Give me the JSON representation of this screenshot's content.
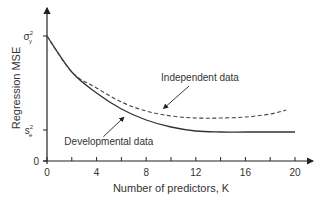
{
  "chart_data": {
    "type": "line",
    "title": "",
    "xlabel": "Number of predictors, K",
    "ylabel": "Regression MSE",
    "xlim": [
      0,
      21
    ],
    "x_ticks": [
      0,
      4,
      8,
      12,
      16,
      20
    ],
    "x_minor_ticks": [
      2,
      6,
      10,
      14,
      18
    ],
    "y_ticks": [
      {
        "value": 0,
        "label": "0"
      },
      {
        "value": 0.248,
        "label": "s_e^2",
        "symbol": "s",
        "sub": "e",
        "sup": "2"
      },
      {
        "value": 1.0,
        "label": "σ_y^2",
        "symbol": "σ",
        "sub": "y",
        "sup": "2"
      }
    ],
    "grid": false,
    "series": [
      {
        "name": "Developmental data",
        "style": "solid",
        "x": [
          0,
          2,
          4,
          6,
          8,
          10,
          12,
          14,
          16,
          18,
          20
        ],
        "values": [
          1.0,
          0.712,
          0.544,
          0.416,
          0.328,
          0.272,
          0.24,
          0.232,
          0.232,
          0.232,
          0.232
        ]
      },
      {
        "name": "Independent data",
        "style": "dashed",
        "x": [
          0,
          2,
          4,
          6,
          8,
          10,
          12,
          14,
          16,
          18,
          19.3
        ],
        "values": [
          1.0,
          0.712,
          0.584,
          0.472,
          0.4,
          0.36,
          0.344,
          0.344,
          0.352,
          0.376,
          0.408
        ]
      }
    ],
    "annotations": [
      {
        "text": "Independent data",
        "x": 9.2,
        "y": 0.64,
        "arrow_to": [
          9.4,
          0.42
        ]
      },
      {
        "text": "Developmental data",
        "x": 1.4,
        "y": 0.13,
        "arrow_to": [
          6.2,
          0.35
        ]
      }
    ]
  }
}
